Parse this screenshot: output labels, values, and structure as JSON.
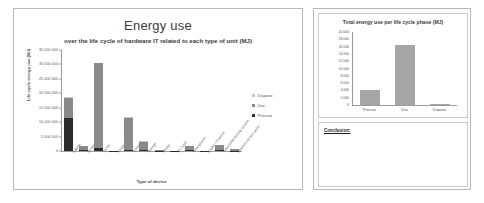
{
  "left_panel": {
    "chart_data": {
      "type": "bar",
      "stacked": true,
      "title": "Energy use",
      "subtitle": "over the life cycle of hardware IT related to each type of unit (MJ)",
      "xlabel": "Type of device",
      "ylabel": "Life cycle energy use (MJ)",
      "ylim": [
        0,
        35000000
      ],
      "yticks": [
        0,
        5000000,
        10000000,
        15000000,
        20000000,
        25000000,
        30000000,
        35000000
      ],
      "ytick_labels": [
        "0",
        "5 000 000",
        "10 000 000",
        "15 000 000",
        "20 000 000",
        "25 000 000",
        "30 000 000",
        "35 000 000"
      ],
      "grid": false,
      "legend_position": "right",
      "categories": [
        "Laptop",
        "Desktop",
        "Server",
        "Router",
        "Screen",
        "Storage",
        "Printer",
        "IP / VoIP",
        "Smartphone",
        "Copier / Scanner",
        "Videoconferencing system",
        "Wireless access point"
      ],
      "series": [
        {
          "name": "Procure",
          "color": "#2b2b2b",
          "values": [
            11500000,
            200000,
            900000,
            40000,
            500000,
            200000,
            60000,
            30000,
            200000,
            60000,
            200000,
            120000
          ]
        },
        {
          "name": "Use",
          "color": "#8a8a8a",
          "values": [
            7000000,
            1500000,
            29600000,
            120000,
            11100000,
            3100000,
            220000,
            90000,
            1600000,
            100000,
            1900000,
            680000
          ]
        },
        {
          "name": "Dispose",
          "color": "#c8c8c8",
          "values": [
            80000,
            20000,
            60000,
            5000,
            40000,
            20000,
            5000,
            3000,
            20000,
            5000,
            20000,
            10000
          ]
        }
      ]
    },
    "legend": [
      {
        "label": "Dispose",
        "color": "#c8c8c8"
      },
      {
        "label": "Use",
        "color": "#8a8a8a"
      },
      {
        "label": "Procure",
        "color": "#2b2b2b"
      }
    ]
  },
  "right_panel": {
    "chart_data": {
      "type": "bar",
      "title": "Total energy use per life cycle phase (MJ)",
      "xlabel": "",
      "ylabel": "",
      "ylim": [
        0,
        20000
      ],
      "yticks": [
        0,
        2000,
        4000,
        6000,
        8000,
        10000,
        12000,
        14000,
        16000,
        18000,
        20000
      ],
      "ytick_labels": [
        "0",
        "2 000",
        "4 000",
        "6 000",
        "8 000",
        "10 000",
        "12 000",
        "14 000",
        "16 000",
        "18 000",
        "20 000"
      ],
      "grid": false,
      "categories": [
        "Procure",
        "Use",
        "Dispose"
      ],
      "values": [
        4000,
        16500,
        60
      ],
      "bar_color": "#a6a6a6"
    },
    "conclusion": {
      "label": "Conclusion:",
      "text": ""
    }
  }
}
